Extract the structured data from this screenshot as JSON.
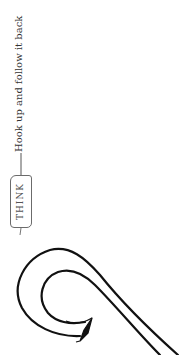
{
  "annotation": {
    "tag": "THINK",
    "text": "Hook up and follow it back",
    "orientation": "rotated -90deg (reads bottom-to-top)"
  },
  "figure": {
    "shape": "hook-curve",
    "arrow": "arrowhead at inner end of hook",
    "stroke_color": "#111111",
    "annotation_color": "#555555"
  }
}
